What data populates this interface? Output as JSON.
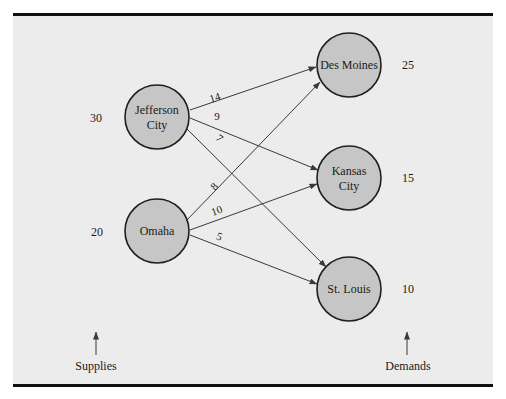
{
  "colors": {
    "panel_background": "#ececec",
    "rule": "#111111",
    "node_fill": "#c6c6c6",
    "node_stroke": "#1e1e1e",
    "edge": "#3a3a3a"
  },
  "supply_nodes": [
    {
      "id": "jefferson_city",
      "label_lines": [
        "Jefferson",
        "City"
      ],
      "supply": "30"
    },
    {
      "id": "omaha",
      "label_lines": [
        "Omaha"
      ],
      "supply": "20"
    }
  ],
  "demand_nodes": [
    {
      "id": "des_moines",
      "label_lines": [
        "Des Moines"
      ],
      "demand": "25"
    },
    {
      "id": "kansas_city",
      "label_lines": [
        "Kansas",
        "City"
      ],
      "demand": "15"
    },
    {
      "id": "st_louis",
      "label_lines": [
        "St. Louis"
      ],
      "demand": "10"
    }
  ],
  "edges": [
    {
      "from": "jefferson_city",
      "to": "des_moines",
      "cost": "14"
    },
    {
      "from": "jefferson_city",
      "to": "kansas_city",
      "cost": "9"
    },
    {
      "from": "jefferson_city",
      "to": "st_louis",
      "cost": "7"
    },
    {
      "from": "omaha",
      "to": "des_moines",
      "cost": "8"
    },
    {
      "from": "omaha",
      "to": "kansas_city",
      "cost": "10"
    },
    {
      "from": "omaha",
      "to": "st_louis",
      "cost": "5"
    }
  ],
  "footer": {
    "supplies_label": "Supplies",
    "demands_label": "Demands"
  }
}
